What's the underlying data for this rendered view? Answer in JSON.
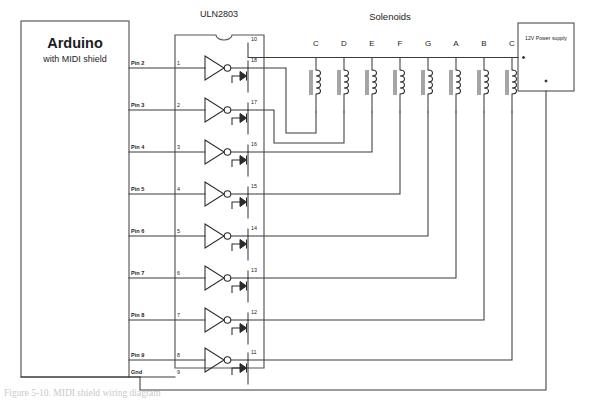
{
  "diagram": {
    "title_blocks": {
      "ic_label": "ULN2803",
      "solenoids_label": "Solenoids",
      "power_supply_label": "12V Power supply"
    },
    "arduino": {
      "name": "Arduino",
      "subtitle": "with MIDI shield"
    },
    "arduino_pins": [
      {
        "label": "Pin 2",
        "ic_pin": "1",
        "out_pin": "18",
        "solenoid": "C"
      },
      {
        "label": "Pin 3",
        "ic_pin": "2",
        "out_pin": "17",
        "solenoid": "D"
      },
      {
        "label": "Pin 4",
        "ic_pin": "3",
        "out_pin": "16",
        "solenoid": "E"
      },
      {
        "label": "Pin 5",
        "ic_pin": "4",
        "out_pin": "15",
        "solenoid": "F"
      },
      {
        "label": "Pin 6",
        "ic_pin": "5",
        "out_pin": "14",
        "solenoid": "G"
      },
      {
        "label": "Pin 7",
        "ic_pin": "6",
        "out_pin": "13",
        "solenoid": "A"
      },
      {
        "label": "Pin 8",
        "ic_pin": "7",
        "out_pin": "12",
        "solenoid": "B"
      },
      {
        "label": "Pin 9",
        "ic_pin": "8",
        "out_pin": "11",
        "solenoid": "C"
      }
    ],
    "ground_pin": {
      "label": "Gnd",
      "ic_pin": "9"
    },
    "common_pin": "10",
    "solenoid_labels": [
      "C",
      "D",
      "E",
      "F",
      "G",
      "A",
      "B",
      "C"
    ],
    "caption": "Figure 5-10. MIDI shield wiring diagram",
    "colors": {
      "wire": "#3b3b3b",
      "symbol": "#2b2b2b",
      "box": "#555555",
      "background": "#ffffff"
    }
  }
}
